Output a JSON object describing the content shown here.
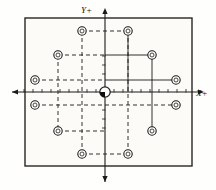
{
  "diagram": {
    "background_color": "#fefefd",
    "line_color": "#1a1a18",
    "plate": {
      "label": "workpiece-plate",
      "x": 25,
      "y": 18,
      "width": 167,
      "height": 148,
      "fill": "#fcfbf8",
      "stroke": "#2a2724",
      "stroke_width": 1.4
    },
    "axes": {
      "origin_x": 105,
      "origin_y": 92,
      "x_axis_label": "X+",
      "y_axis_label": "Y+",
      "x_label_x": 196,
      "x_label_y": 96,
      "y_label_x": 92,
      "y_label_y": 13,
      "x_axis_start": 12,
      "x_axis_end": 204,
      "y_axis_start": 8,
      "y_axis_end": 182,
      "tick_spacing": 9,
      "tick_length": 3,
      "tick_count_each_side": 9
    },
    "origin_marker": {
      "label": "origin-datum-marker",
      "cx": 105,
      "cy": 92,
      "radius": 5.2,
      "filled_quadrant": "lower-left",
      "fill": "#ffffff",
      "accent": "#0d0d0c"
    },
    "hole_radius_outer": 4.2,
    "hole_radius_inner": 2.0,
    "hole_fill": "#ffffff",
    "holes": [
      {
        "id": "hole-1",
        "label": "top-left-inner",
        "cx": 82,
        "cy": 31,
        "quadrant": "upper-left"
      },
      {
        "id": "hole-2",
        "label": "top-right-inner",
        "cx": 128,
        "cy": 31,
        "quadrant": "upper-right"
      },
      {
        "id": "hole-3",
        "label": "upper-left-mid",
        "cx": 58,
        "cy": 55,
        "quadrant": "upper-left"
      },
      {
        "id": "hole-4",
        "label": "upper-right-mid",
        "cx": 152,
        "cy": 55,
        "quadrant": "upper-right"
      },
      {
        "id": "hole-5",
        "label": "upper-left-outer",
        "cx": 35,
        "cy": 80,
        "quadrant": "upper-left"
      },
      {
        "id": "hole-6",
        "label": "upper-right-outer",
        "cx": 176,
        "cy": 80,
        "quadrant": "upper-right"
      },
      {
        "id": "hole-7",
        "label": "lower-left-outer",
        "cx": 35,
        "cy": 105,
        "quadrant": "lower-left"
      },
      {
        "id": "hole-8",
        "label": "lower-right-outer",
        "cx": 176,
        "cy": 105,
        "quadrant": "lower-right"
      },
      {
        "id": "hole-9",
        "label": "lower-left-mid",
        "cx": 58,
        "cy": 131,
        "quadrant": "lower-left"
      },
      {
        "id": "hole-10",
        "label": "lower-right-mid",
        "cx": 152,
        "cy": 131,
        "quadrant": "lower-right"
      },
      {
        "id": "hole-11",
        "label": "bottom-left-inner",
        "cx": 82,
        "cy": 154,
        "quadrant": "lower-left"
      },
      {
        "id": "hole-12",
        "label": "bottom-right-inner",
        "cx": 128,
        "cy": 154,
        "quadrant": "lower-right"
      }
    ],
    "construction_lines_dashed": [
      {
        "id": "dash-h-top",
        "x1": 82,
        "y1": 31,
        "x2": 128,
        "y2": 31
      },
      {
        "id": "dash-h-upmid",
        "x1": 58,
        "y1": 55,
        "x2": 105,
        "y2": 55
      },
      {
        "id": "dash-h-upout",
        "x1": 35,
        "y1": 80,
        "x2": 105,
        "y2": 80
      },
      {
        "id": "dash-h-lowout",
        "x1": 35,
        "y1": 105,
        "x2": 176,
        "y2": 105
      },
      {
        "id": "dash-h-lowmid",
        "x1": 58,
        "y1": 131,
        "x2": 105,
        "y2": 131
      },
      {
        "id": "dash-h-bottom",
        "x1": 82,
        "y1": 154,
        "x2": 128,
        "y2": 154
      },
      {
        "id": "dash-v-left1",
        "x1": 82,
        "y1": 31,
        "x2": 82,
        "y2": 154
      },
      {
        "id": "dash-v-left2",
        "x1": 58,
        "y1": 55,
        "x2": 58,
        "y2": 131
      },
      {
        "id": "dash-v-right1",
        "x1": 128,
        "y1": 31,
        "x2": 128,
        "y2": 154
      }
    ],
    "dimension_lines_solid": [
      {
        "id": "solid-h-upmid",
        "x1": 105,
        "y1": 55,
        "x2": 152,
        "y2": 55
      },
      {
        "id": "solid-h-upout",
        "x1": 105,
        "y1": 80,
        "x2": 176,
        "y2": 80
      },
      {
        "id": "solid-v-mid",
        "x1": 128,
        "y1": 31,
        "x2": 128,
        "y2": 92
      },
      {
        "id": "solid-v-far",
        "x1": 152,
        "y1": 55,
        "x2": 152,
        "y2": 131
      }
    ],
    "dash_pattern": "4,3",
    "dash_stroke_width": 0.9,
    "solid_stroke_width": 0.9
  }
}
